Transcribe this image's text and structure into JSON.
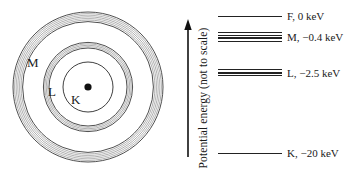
{
  "figure": {
    "type": "atomic-shell-and-energy-level-diagram",
    "colors": {
      "ink": "#1a1a1a",
      "line": "#222222",
      "ring_hatch": "#777777",
      "ring_edge": "#3a3a3a",
      "background": "#ffffff"
    },
    "atom": {
      "shells": [
        {
          "label": "M"
        },
        {
          "label": "L"
        },
        {
          "label": "K"
        }
      ],
      "nucleus": "filled dot"
    },
    "axis": {
      "label": "Potential energy (not to scale)",
      "direction": "up"
    },
    "levels": [
      {
        "name": "F",
        "energy_keV": 0,
        "label": "F, 0 keV",
        "style": "single line"
      },
      {
        "name": "M",
        "energy_keV": -0.4,
        "label": "M, −0.4 keV",
        "style": "band of lines"
      },
      {
        "name": "L",
        "energy_keV": -2.5,
        "label": "L, −2.5 keV",
        "style": "band of lines"
      },
      {
        "name": "K",
        "energy_keV": -20,
        "label": "K, −20 keV",
        "style": "single line"
      }
    ]
  }
}
